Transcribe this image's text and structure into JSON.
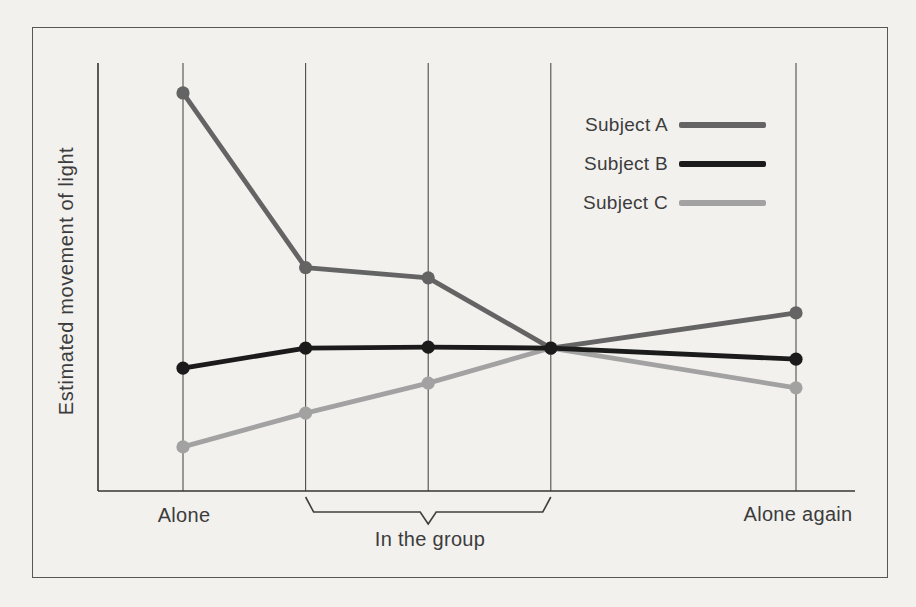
{
  "figure": {
    "background_color": "#f2f1ee",
    "frame_border_color": "#575757"
  },
  "chart_data": {
    "type": "line",
    "ylabel": "Estimated movement of light",
    "categories": [
      "Alone",
      "In the group",
      "In the group",
      "In the group",
      "Alone again"
    ],
    "session_x": [
      0,
      1,
      2,
      3,
      5
    ],
    "ylim": [
      0,
      10
    ],
    "y_ticks": "none (no numeric scale shown)",
    "grid": "vertical gridlines only, at each session position",
    "legend_position": "top-right inside plot",
    "axis_color": "#343434",
    "gridline_color": "#4d4d4d",
    "bracket_color": "#3f3f3f",
    "series": [
      {
        "name": "Subject A",
        "color": "#646464",
        "values": [
          9.3,
          5.22,
          4.98,
          3.34,
          4.16
        ]
      },
      {
        "name": "Subject B",
        "color": "#1b1b1b",
        "values": [
          2.87,
          3.34,
          3.36,
          3.34,
          3.08
        ]
      },
      {
        "name": "Subject C",
        "color": "#a2a2a2",
        "values": [
          1.03,
          1.82,
          2.52,
          3.34,
          2.41
        ]
      }
    ],
    "x_labels": [
      {
        "text": "Alone",
        "session": 0
      },
      {
        "text": "In the group",
        "sessions": [
          1,
          3
        ],
        "bracket": true
      },
      {
        "text": "Alone again",
        "session": 5
      }
    ]
  }
}
